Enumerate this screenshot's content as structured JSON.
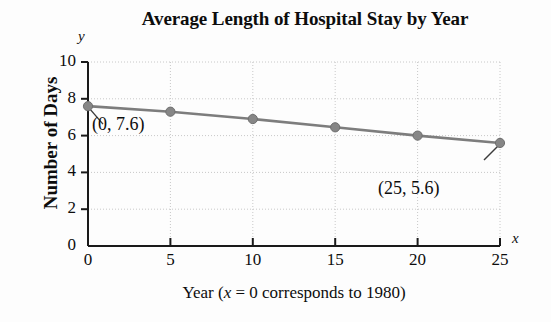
{
  "chart_data": {
    "type": "line",
    "title": "Average Length of Hospital Stay by Year",
    "xlabel": "Year (x = 0 corresponds to 1980)",
    "ylabel": "Number of Days",
    "x_axis_letter": "y",
    "y_axis_letter": "x",
    "x": [
      0,
      5,
      10,
      15,
      20,
      25
    ],
    "values": [
      7.6,
      7.3,
      6.9,
      6.45,
      6.0,
      5.6
    ],
    "series": [
      {
        "name": "Average length of hospital stay",
        "values": [
          7.6,
          7.3,
          6.9,
          6.45,
          6.0,
          5.6
        ]
      }
    ],
    "xlim": [
      0,
      25
    ],
    "ylim": [
      0,
      10
    ],
    "xticks": [
      "0",
      "5",
      "10",
      "15",
      "20",
      "25"
    ],
    "yticks": [
      "0",
      "2",
      "4",
      "6",
      "8",
      "10"
    ],
    "xtick_values": [
      0,
      5,
      10,
      15,
      20,
      25
    ],
    "ytick_values": [
      0,
      2,
      4,
      6,
      8,
      10
    ],
    "grid": true,
    "legend": "none",
    "line_color": "#7d7d7d",
    "marker_color": "#868686",
    "axis_color": "#1a1a1a",
    "grid_color": "#c8c8c8",
    "annotations": [
      {
        "label": "(0, 7.6)",
        "x": 0,
        "y": 7.6
      },
      {
        "label": "(25, 5.6)",
        "x": 25,
        "y": 5.6
      }
    ]
  },
  "caption": {
    "prefix": "Year (",
    "variable": "x",
    "suffix": " = 0 corresponds to 1980)"
  }
}
